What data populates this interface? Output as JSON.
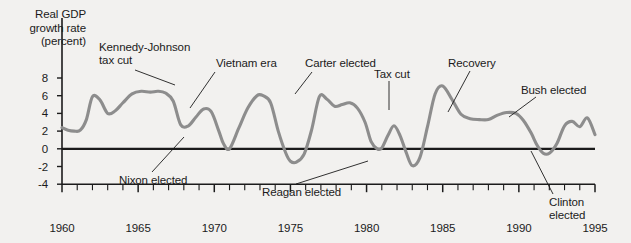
{
  "chart_data": {
    "type": "line",
    "title": "",
    "ylabel": "Real GDP growth rate (percent)",
    "ylabel_lines": [
      "Real GDP",
      "growth rate",
      "(percent)"
    ],
    "xlabel": "",
    "xlim": [
      1960,
      1995
    ],
    "ylim": [
      -4,
      9
    ],
    "grid": false,
    "legend": "none",
    "line_color": "#8d8d8d",
    "axis_color": "#1b1b1b",
    "background_color": "#f2f1ef",
    "y_ticks": [
      "8",
      "6",
      "4",
      "2",
      "0",
      "-2",
      "-4"
    ],
    "y_tick_values": [
      8,
      6,
      4,
      2,
      0,
      -2,
      -4
    ],
    "x_ticks": [
      "1960",
      "1965",
      "1970",
      "1975",
      "1980",
      "1985",
      "1990",
      "1995"
    ],
    "x_tick_values": [
      1960,
      1965,
      1970,
      1975,
      1980,
      1985,
      1990,
      1995
    ],
    "x_minor_tick_interval": 1,
    "series_name": "Real GDP growth rate",
    "x": [
      1960.0,
      1960.4,
      1960.8,
      1961.2,
      1961.6,
      1962.0,
      1962.5,
      1963.0,
      1963.5,
      1964.0,
      1964.6,
      1965.2,
      1965.8,
      1966.3,
      1966.8,
      1967.3,
      1967.8,
      1968.3,
      1968.8,
      1969.3,
      1969.8,
      1970.3,
      1970.6,
      1971.0,
      1971.6,
      1972.2,
      1972.8,
      1973.2,
      1973.7,
      1974.2,
      1974.7,
      1975.0,
      1975.4,
      1975.9,
      1976.4,
      1976.9,
      1977.4,
      1977.9,
      1978.4,
      1978.9,
      1979.4,
      1979.9,
      1980.3,
      1980.7,
      1981.0,
      1981.4,
      1981.8,
      1982.2,
      1982.6,
      1983.0,
      1983.5,
      1984.0,
      1984.5,
      1985.0,
      1985.6,
      1986.2,
      1986.8,
      1987.4,
      1988.0,
      1988.6,
      1989.2,
      1989.8,
      1990.3,
      1990.8,
      1991.2,
      1991.6,
      1992.0,
      1992.5,
      1993.0,
      1993.5,
      1994.0,
      1994.5,
      1995.0
    ],
    "y": [
      2.4,
      2.1,
      2.0,
      2.1,
      3.3,
      5.9,
      5.5,
      4.0,
      4.3,
      5.2,
      6.2,
      6.5,
      6.4,
      6.5,
      6.3,
      5.4,
      2.7,
      2.6,
      3.6,
      4.5,
      4.2,
      2.0,
      0.6,
      0.0,
      2.3,
      4.6,
      6.0,
      6.0,
      5.2,
      2.0,
      -0.5,
      -1.4,
      -1.5,
      -0.6,
      2.2,
      5.9,
      5.6,
      4.8,
      5.0,
      5.2,
      4.6,
      3.0,
      0.8,
      0.0,
      0.1,
      1.5,
      2.6,
      1.5,
      -0.4,
      -1.9,
      -1.0,
      2.5,
      6.2,
      7.1,
      5.6,
      3.9,
      3.4,
      3.3,
      3.3,
      3.8,
      4.1,
      4.0,
      3.2,
      1.8,
      0.4,
      -0.5,
      -0.5,
      0.6,
      2.6,
      3.1,
      2.5,
      3.5,
      1.6
    ],
    "annotations": [
      {
        "id": "kennedy-johnson-tax-cut",
        "lines": [
          "Kennedy-Johnson",
          "tax cut"
        ],
        "text": "Kennedy-Johnson tax cut"
      },
      {
        "id": "vietnam-era",
        "lines": [
          "Vietnam era"
        ],
        "text": "Vietnam era"
      },
      {
        "id": "carter-elected",
        "lines": [
          "Carter elected"
        ],
        "text": "Carter elected"
      },
      {
        "id": "tax-cut",
        "lines": [
          "Tax cut"
        ],
        "text": "Tax cut"
      },
      {
        "id": "recovery",
        "lines": [
          "Recovery"
        ],
        "text": "Recovery"
      },
      {
        "id": "bush-elected",
        "lines": [
          "Bush elected"
        ],
        "text": "Bush elected"
      },
      {
        "id": "nixon-elected",
        "lines": [
          "Nixon elected"
        ],
        "text": "Nixon elected"
      },
      {
        "id": "reagan-elected",
        "lines": [
          "Reagan elected"
        ],
        "text": "Reagan elected"
      },
      {
        "id": "clinton-elected",
        "lines": [
          "Clinton",
          "elected"
        ],
        "text": "Clinton elected"
      }
    ]
  },
  "axis_title": {
    "line1": "Real GDP",
    "line2": "growth rate",
    "line3": "(percent)"
  },
  "y_labels": {
    "t0": "8",
    "t1": "6",
    "t2": "4",
    "t3": "2",
    "t4": "0",
    "t5": "-2",
    "t6": "-4"
  },
  "x_labels": {
    "t0": "1960",
    "t1": "1965",
    "t2": "1970",
    "t3": "1975",
    "t4": "1980",
    "t5": "1985",
    "t6": "1990",
    "t7": "1995"
  },
  "annotations": {
    "kennedy_johnson_l1": "Kennedy-Johnson",
    "kennedy_johnson_l2": "tax cut",
    "vietnam": "Vietnam era",
    "carter": "Carter elected",
    "tax_cut": "Tax cut",
    "recovery": "Recovery",
    "bush": "Bush elected",
    "nixon": "Nixon elected",
    "reagan": "Reagan elected",
    "clinton_l1": "Clinton",
    "clinton_l2": "elected"
  }
}
